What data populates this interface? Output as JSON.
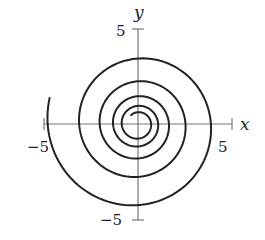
{
  "chart_data": {
    "type": "line",
    "title": "",
    "xlabel": "x",
    "ylabel": "y",
    "xlim": [
      -5,
      5
    ],
    "ylim": [
      -5,
      5
    ],
    "grid": false,
    "legend": null,
    "tick_labels": {
      "x": [
        "-5",
        "5"
      ],
      "y": [
        "5",
        "-5"
      ]
    },
    "series": [
      {
        "name": "spiral",
        "kind": "logarithmic-spiral (clockwise outward)",
        "start": {
          "x": -0.37,
          "y": 0.48
        },
        "end": {
          "x": -1.1,
          "y": 4.8
        },
        "start_radius": 0.6,
        "end_radius": 4.9,
        "turns": 4.9,
        "axis_crossings": {
          "positive_x": [
            0.85,
            1.35,
            1.8,
            2.6,
            3.75
          ],
          "negative_x": [
            -0.85,
            -1.4,
            -2.05,
            -3.0,
            -4.5
          ],
          "positive_y": [
            0.6,
            1.0,
            1.5,
            2.3,
            3.6
          ],
          "negative_y": [
            -0.85,
            -1.4,
            -2.3,
            -3.3,
            -4.45
          ]
        }
      }
    ]
  },
  "labels": {
    "x_axis": "x",
    "y_axis": "y",
    "x_neg": "−5",
    "x_pos": "5",
    "y_pos": "5",
    "y_neg": "−5"
  }
}
